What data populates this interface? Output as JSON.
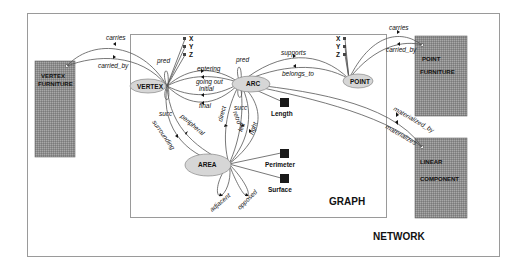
{
  "diagram": {
    "containers": {
      "network": {
        "label": "NETWORK"
      },
      "graph": {
        "label": "GRAPH"
      }
    },
    "external_classes": {
      "vertex_furniture": {
        "line1": "VERTEX",
        "line2": "FURNITURE"
      },
      "point_furniture": {
        "line1": "POINT",
        "line2": "FURNITURE"
      },
      "linear_component": {
        "line1": "LINEAR",
        "line2": "COMPONENT"
      }
    },
    "nodes": {
      "vertex": "VERTEX",
      "arc": "ARC",
      "point": "POINT",
      "area": "AREA"
    },
    "attributes": {
      "vertex_x": "X",
      "vertex_y": "Y",
      "vertex_z": "Z",
      "point_x": "X",
      "point_y": "Y",
      "point_z": "Z",
      "length": "Length",
      "perimeter": "Perimeter",
      "surface": "Surface"
    },
    "relations": {
      "vf_carries": "carries",
      "vf_carried_by": "carried_by",
      "pf_carries": "carries",
      "pf_carried_by": "carried_by",
      "vertex_pred": "pred",
      "vertex_succ": "succ",
      "arc_pred": "pred",
      "arc_succ": "succ",
      "entering": "entering",
      "going_out": "going out",
      "initial": "initial",
      "final": "final",
      "supports": "supports",
      "belongs_to": "belongs_to",
      "peripheral": "peripheral",
      "surrounding": "surrounding",
      "direct": "direct",
      "retro": "retro",
      "left": "left",
      "right": "right",
      "adjacent": "adjacent",
      "opposed": "opposed",
      "materialized_by": "materialized_by",
      "materializes": "materializes"
    },
    "colors": {
      "box_fill": "#8a8a8a",
      "ellipse_fill": "#d6d6d6",
      "border": "#9a9a9a",
      "attr_square": "#1a1a1a"
    }
  }
}
